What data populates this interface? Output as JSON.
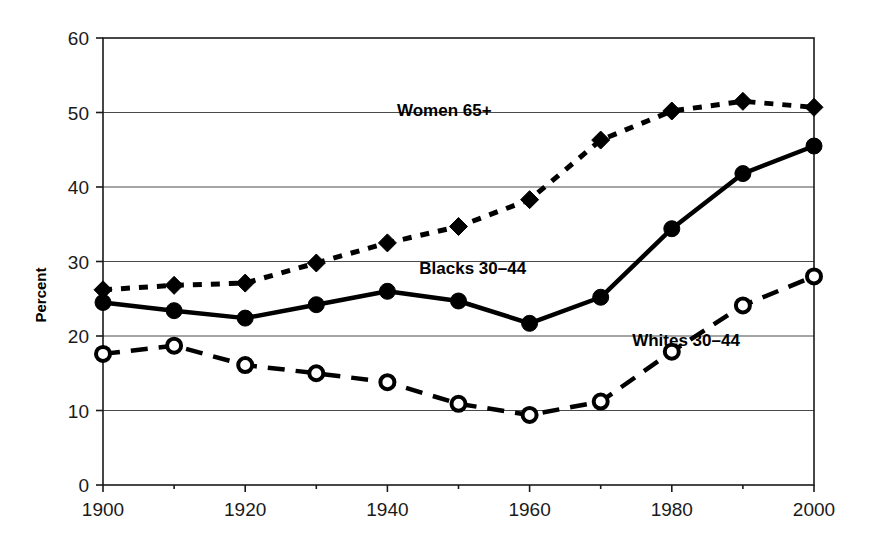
{
  "chart_data": {
    "type": "line",
    "title": "",
    "xlabel": "",
    "ylabel": "Percent",
    "x": [
      1900,
      1910,
      1920,
      1930,
      1940,
      1950,
      1960,
      1970,
      1980,
      1990,
      2000
    ],
    "xlim": [
      1900,
      2000
    ],
    "ylim": [
      0,
      60
    ],
    "xticks": [
      1900,
      1920,
      1940,
      1960,
      1980,
      2000
    ],
    "xtick_labels": [
      "1900",
      "1920",
      "1940",
      "1960",
      "1980",
      "2000"
    ],
    "xticks_minor": [
      1910,
      1930,
      1950,
      1970,
      1990
    ],
    "yticks": [
      0,
      10,
      20,
      30,
      40,
      50,
      60
    ],
    "ytick_labels": [
      "0",
      "10",
      "20",
      "30",
      "40",
      "50",
      "60"
    ],
    "grid": "horizontal",
    "legend_position": "inline-annotations",
    "series": [
      {
        "name": "Women 65+",
        "marker": "filled-diamond",
        "linestyle": "dotted",
        "color": "#000000",
        "values": [
          26.2,
          26.8,
          27.1,
          29.8,
          32.5,
          34.7,
          38.3,
          46.3,
          50.2,
          51.5,
          50.7
        ],
        "label_x": 1948,
        "label_y": 49.5
      },
      {
        "name": "Blacks 30–44",
        "marker": "filled-circle",
        "linestyle": "solid",
        "color": "#000000",
        "values": [
          24.5,
          23.4,
          22.4,
          24.2,
          26.0,
          24.7,
          21.7,
          25.2,
          34.4,
          41.8,
          45.5
        ],
        "label_x": 1952,
        "label_y": 28.3
      },
      {
        "name": "Whites 30–44",
        "marker": "open-circle",
        "linestyle": "dashed",
        "color": "#000000",
        "values": [
          17.6,
          18.7,
          16.1,
          15.0,
          13.8,
          10.9,
          9.4,
          11.2,
          17.9,
          24.1,
          28.0
        ],
        "label_x": 1982,
        "label_y": 18.6
      }
    ]
  }
}
